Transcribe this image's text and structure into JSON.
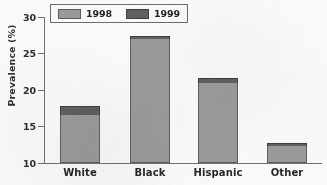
{
  "chart_data": {
    "type": "bar",
    "title": "",
    "subtitle": "",
    "xlabel": "",
    "ylabel": "Prevalence (%)",
    "ylim": [
      10,
      30
    ],
    "yticks": [
      10,
      15,
      20,
      25,
      30
    ],
    "ytick_labels": [
      "10",
      "15",
      "20",
      "25",
      "30"
    ],
    "grid": false,
    "stacked": true,
    "legend_position": "top-left",
    "categories": [
      "White",
      "Black",
      "Hispanic",
      "Other"
    ],
    "series": [
      {
        "name": "1998",
        "color": "#9a9a9a",
        "values": [
          16.6,
          27.0,
          21.0,
          12.3
        ]
      },
      {
        "name": "1999",
        "color": "#5e5e5e",
        "values": [
          1.2,
          0.4,
          0.6,
          0.4
        ]
      }
    ],
    "totals": [
      17.8,
      27.4,
      21.6,
      12.7
    ],
    "annotations": []
  },
  "legend": {
    "entries": [
      {
        "label": "1998",
        "swatch_name": "legend-swatch-1998"
      },
      {
        "label": "1999",
        "swatch_name": "legend-swatch-1999"
      }
    ]
  },
  "axis": {
    "y_title": "Prevalence (%)",
    "y_tick_labels": [
      "30",
      "25",
      "20",
      "15",
      "10"
    ],
    "x_tick_labels": [
      "White",
      "Black",
      "Hispanic",
      "Other"
    ]
  }
}
